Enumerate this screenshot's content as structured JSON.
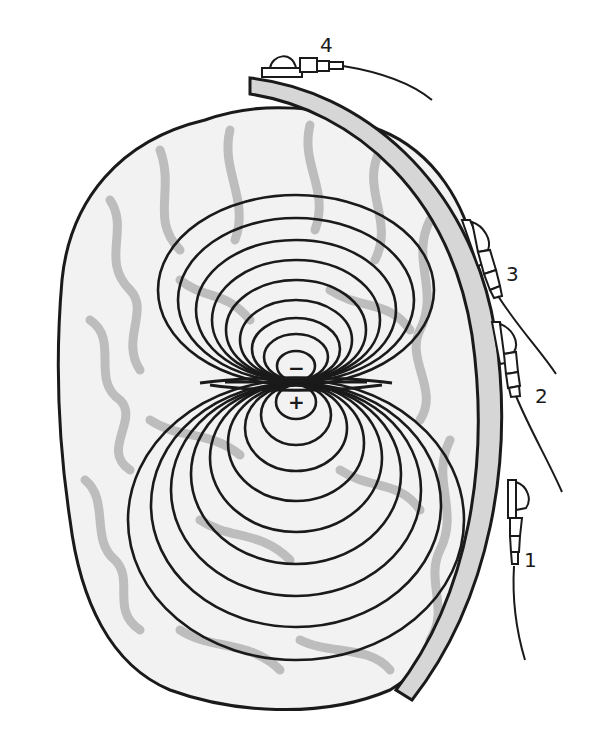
{
  "diagram": {
    "type": "dipole-field-over-brain-with-scalp-electrodes",
    "colors": {
      "outline": "#1a1a1a",
      "brain_fill": "#f2f2f2",
      "sulci": "#bdbdbd",
      "skull": "#d6d6d6",
      "background": "#ffffff"
    },
    "dipole": {
      "negative_pole": "−",
      "positive_pole": "+"
    },
    "electrodes": [
      {
        "id": "electrode-1",
        "label": "1"
      },
      {
        "id": "electrode-2",
        "label": "2"
      },
      {
        "id": "electrode-3",
        "label": "3"
      },
      {
        "id": "electrode-4",
        "label": "4"
      }
    ]
  }
}
